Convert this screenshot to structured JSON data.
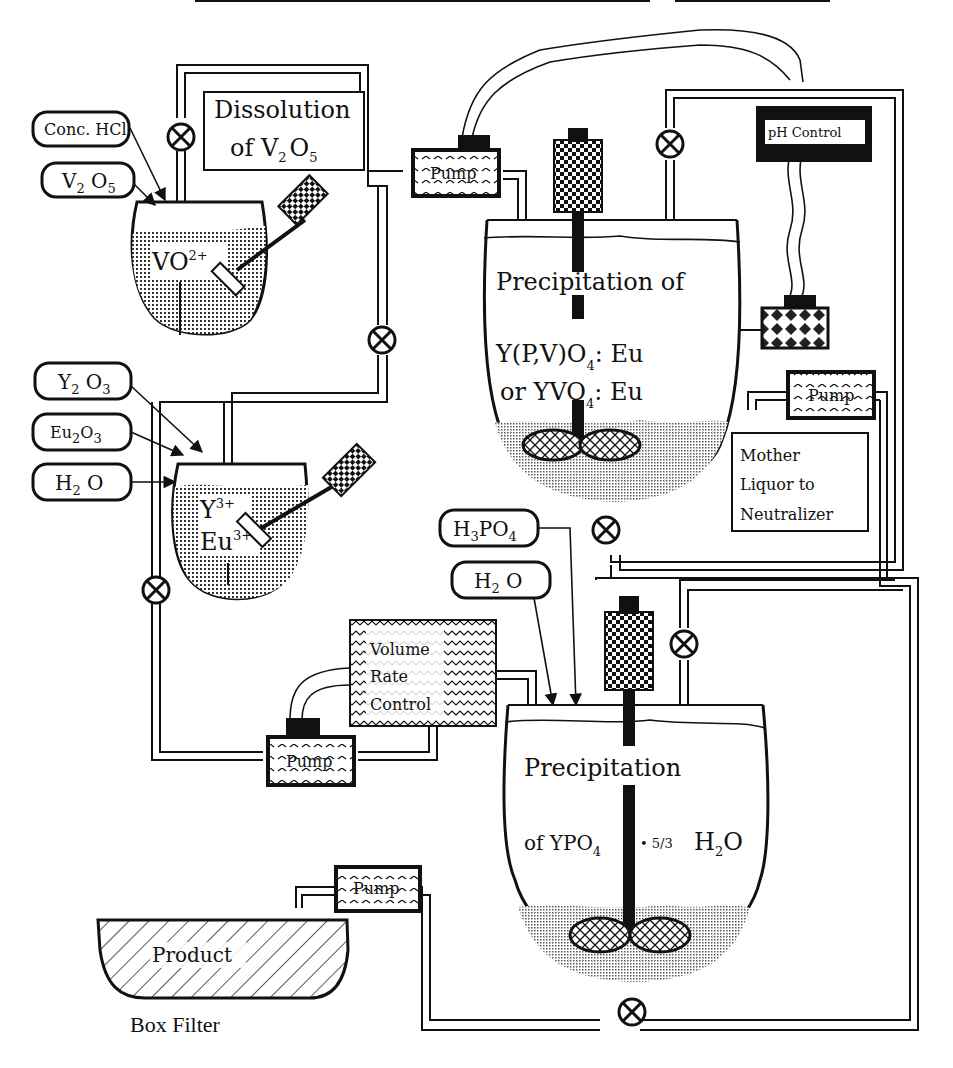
{
  "diagram": {
    "title_clipped": "",
    "dissolution_label": {
      "line1": "Dissolution",
      "line2_prefix": "of V",
      "line2_sub1": "2",
      "line2_mid": "O",
      "line2_sub2": "5"
    },
    "inputs_top": [
      {
        "id": "conc-hcl",
        "label": "Conc. HCl"
      },
      {
        "id": "v2o5",
        "label_main": "V",
        "sub1": "2",
        "mid": " O",
        "sub2": "5"
      }
    ],
    "vessel1_content": {
      "main": "VO",
      "sup": "2+"
    },
    "inputs_mid": [
      {
        "id": "y2o3",
        "label_main": "Y",
        "sub1": "2",
        "mid": " O",
        "sub2": "3"
      },
      {
        "id": "eu2o3",
        "label_main": "Eu",
        "sub1": "2",
        "mid": "O",
        "sub2": "3"
      },
      {
        "id": "h2o-1",
        "label_main": "H",
        "sub1": "2",
        "mid": " O"
      }
    ],
    "vessel2_content": {
      "line1_main": "Y",
      "line1_sup": "3+",
      "line2_main": "Eu",
      "line2_sup": "3+"
    },
    "pump_label": "Pump",
    "ph_control_label": "pH Control",
    "precip1": {
      "line1": "Precipitation of",
      "line2_main": "Y(P,V)O",
      "line2_sub": "4",
      "line2_end": ": Eu",
      "line3_main": "or YVO",
      "line3_sub": "4",
      "line3_end": ": Eu"
    },
    "mother_liquor": {
      "line1": "Mother",
      "line2": "Liquor to",
      "line3": "Neutralizer"
    },
    "inputs_bottom": [
      {
        "id": "h3po4",
        "label_main": "H",
        "sub1": "3",
        "mid": "PO",
        "sub2": "4"
      },
      {
        "id": "h2o-2",
        "label_main": "H",
        "sub1": "2",
        "mid": " O"
      }
    ],
    "volume_rate_control": {
      "line1": "Volume",
      "line2": "Rate",
      "line3": "Control"
    },
    "precip2": {
      "line1": "Precipitation",
      "line2_main": "of YPO",
      "line2_sub": "4",
      "line2_dot": "• 5/3",
      "line2_h": "H",
      "line2_hsub": "2",
      "line2_o": "O"
    },
    "product_label": "Product",
    "box_filter_label": "Box Filter",
    "colors": {
      "ink": "#111111",
      "background": "#ffffff"
    }
  }
}
